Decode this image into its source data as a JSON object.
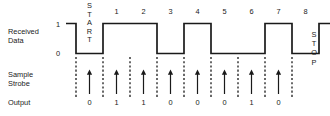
{
  "figure": {
    "rows": {
      "received_data_label_line1": "Received",
      "received_data_label_line2": "Data",
      "sample_strobe_label_line1": "Sample",
      "sample_strobe_label_line2": "Strobe",
      "output_label": "Output"
    },
    "level_labels": {
      "high": "1",
      "low": "0"
    },
    "start_label": "START",
    "stop_label": "STOP",
    "bit_numbers": [
      "1",
      "2",
      "3",
      "4",
      "5",
      "6",
      "7",
      "8"
    ],
    "output_bits": [
      "0",
      "1",
      "1",
      "0",
      "0",
      "0",
      "1",
      "0"
    ],
    "colors": {
      "ink": "#1a1a1a",
      "background": "#ffffff"
    }
  },
  "chart_data": {
    "type": "line",
    "title": "",
    "subtitle": "",
    "xlabel": "",
    "ylabel": "Received Data",
    "grid": false,
    "legend_position": "none",
    "ylim": [
      0,
      1
    ],
    "categories": [
      "IDLE",
      "START",
      "1",
      "2",
      "3",
      "4",
      "5",
      "6",
      "7",
      "8",
      "STOP"
    ],
    "series": [
      {
        "name": "Received Data",
        "values": [
          1,
          0,
          1,
          1,
          0,
          1,
          0,
          0,
          1,
          0,
          1
        ]
      },
      {
        "name": "Output",
        "values": [
          null,
          0,
          1,
          1,
          0,
          0,
          0,
          1,
          0,
          null,
          null
        ]
      }
    ],
    "annotations": [
      "START bit is low for one bit period",
      "Sample strobe arrows occur at the center of each bit cell",
      "STOP bit returns line to the high idle level"
    ]
  }
}
